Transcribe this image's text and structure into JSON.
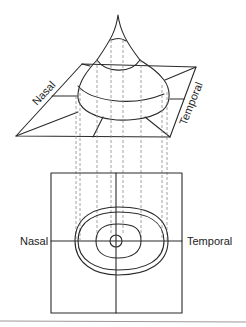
{
  "figure": {
    "top_view": {
      "label_left": "Nasal",
      "label_right": "Temporal"
    },
    "bottom_view": {
      "label_left": "Nasal",
      "label_right": "Temporal"
    }
  }
}
